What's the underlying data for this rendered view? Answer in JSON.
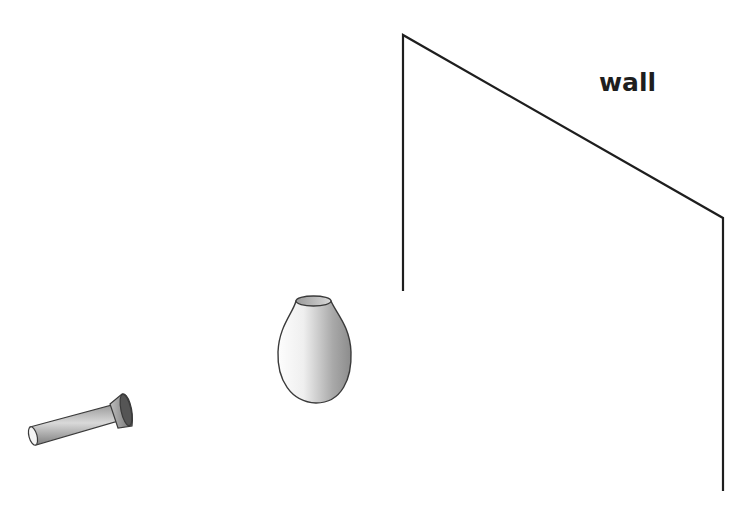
{
  "diagram": {
    "title": "",
    "labels": {
      "wall": "wall"
    },
    "objects": [
      {
        "name": "flashlight",
        "description": "cylindrical flashlight pointing toward the vase"
      },
      {
        "name": "vase",
        "description": "shaded vase/bottle between flashlight and wall"
      },
      {
        "name": "wall",
        "description": "wall drawn in perspective as an outlined plane"
      }
    ],
    "colors": {
      "line": "#1e1e1e",
      "shade_dark": "#7a7a7a",
      "shade_light": "#f2f2f2",
      "background": "#ffffff"
    }
  }
}
